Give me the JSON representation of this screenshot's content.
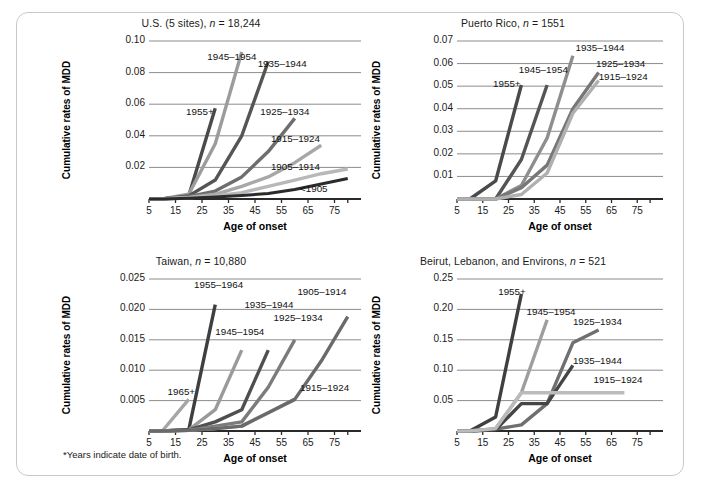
{
  "figure": {
    "footnote": "*Years indicate date of birth.",
    "shared": {
      "xlabel": "Age of onset",
      "ylabel": "Cumulative rates of MDD",
      "xticks": [
        "5",
        "15",
        "25",
        "35",
        "45",
        "55",
        "65",
        "75"
      ]
    }
  },
  "chart_data": [
    {
      "type": "line",
      "id": "us",
      "title": "U.S. (5 sites), n = 18,244",
      "title_plain": "U.S. (5 sites),",
      "title_italic": "n",
      "title_tail": "= 18,244",
      "xlabel": "Age of onset",
      "ylabel": "Cumulative rates of MDD",
      "xlim": [
        0,
        80
      ],
      "ylim": [
        0,
        0.1
      ],
      "xticks": [
        5,
        15,
        25,
        35,
        45,
        55,
        65,
        75
      ],
      "yticks": [
        0.02,
        0.04,
        0.06,
        0.08,
        0.1
      ],
      "ytick_labels": [
        "0.02",
        "0.04",
        "0.06",
        "0.08",
        "0.10"
      ],
      "grid": true,
      "legend_position": "inline-annotations",
      "series": [
        {
          "name": "1955+",
          "color": "#4a4a4a",
          "x": [
            0,
            5,
            15,
            25
          ],
          "values": [
            0,
            0,
            0.002,
            0.0575
          ]
        },
        {
          "name": "1945–1954",
          "color": "#9c9c9c",
          "x": [
            0,
            5,
            15,
            25,
            35
          ],
          "values": [
            0,
            0,
            0.003,
            0.035,
            0.093
          ]
        },
        {
          "name": "1935–1944",
          "color": "#555555",
          "x": [
            0,
            5,
            15,
            25,
            35,
            45
          ],
          "values": [
            0,
            0,
            0.002,
            0.012,
            0.04,
            0.087
          ]
        },
        {
          "name": "1925–1934",
          "color": "#6e6e6e",
          "x": [
            0,
            5,
            15,
            25,
            35,
            45,
            55
          ],
          "values": [
            0,
            0,
            0.0015,
            0.005,
            0.014,
            0.03,
            0.051
          ]
        },
        {
          "name": "1915–1924",
          "color": "#a8a8a8",
          "x": [
            0,
            5,
            15,
            25,
            35,
            45,
            55,
            65
          ],
          "values": [
            0,
            0,
            0.001,
            0.003,
            0.008,
            0.014,
            0.023,
            0.034
          ]
        },
        {
          "name": "1905–1914",
          "color": "#b8b8b8",
          "x": [
            0,
            5,
            15,
            25,
            35,
            45,
            55,
            65,
            75
          ],
          "values": [
            0,
            0,
            0.0008,
            0.002,
            0.004,
            0.008,
            0.012,
            0.016,
            0.019
          ]
        },
        {
          "name": "<1905",
          "color": "#2b2b2b",
          "x": [
            0,
            5,
            15,
            25,
            35,
            45,
            55,
            65,
            75
          ],
          "values": [
            0,
            0,
            0.0005,
            0.0012,
            0.0022,
            0.0035,
            0.006,
            0.0095,
            0.013
          ]
        }
      ],
      "annotations": [
        {
          "text": "1945–1954",
          "x": 22,
          "y": 0.0895
        },
        {
          "text": "1935–1944",
          "x": 41,
          "y": 0.085
        },
        {
          "text": "1955+",
          "x": 14,
          "y": 0.0545
        },
        {
          "text": "1925–1934",
          "x": 42,
          "y": 0.0545
        },
        {
          "text": "1915–1924",
          "x": 46,
          "y": 0.0375
        },
        {
          "text": "1905–1914",
          "x": 46,
          "y": 0.0195
        },
        {
          "text": "<1905",
          "x": 57,
          "y": 0.0055
        }
      ]
    },
    {
      "type": "line",
      "id": "puerto_rico",
      "title": "Puerto Rico, n = 1551",
      "title_plain": "Puerto Rico,",
      "title_italic": "n",
      "title_tail": "= 1551",
      "xlabel": "Age of onset",
      "ylabel": "Cumulative rates of MDD",
      "xlim": [
        0,
        80
      ],
      "ylim": [
        0,
        0.07
      ],
      "xticks": [
        5,
        15,
        25,
        35,
        45,
        55,
        65,
        75
      ],
      "yticks": [
        0.01,
        0.02,
        0.03,
        0.04,
        0.05,
        0.06,
        0.07
      ],
      "ytick_labels": [
        "0.01",
        "0.02",
        "0.03",
        "0.04",
        "0.05",
        "0.06",
        "0.07"
      ],
      "grid": true,
      "legend_position": "inline-annotations",
      "series": [
        {
          "name": "1955+",
          "color": "#4a4a4a",
          "x": [
            0,
            5,
            15,
            25
          ],
          "values": [
            0,
            0,
            0.008,
            0.0505
          ]
        },
        {
          "name": "1945–1954",
          "color": "#555555",
          "x": [
            0,
            5,
            15,
            25,
            35
          ],
          "values": [
            0,
            0,
            0,
            0.0175,
            0.0505
          ]
        },
        {
          "name": "1935–1944",
          "color": "#8e8e8e",
          "x": [
            0,
            5,
            15,
            25,
            35,
            45
          ],
          "values": [
            0,
            0,
            0,
            0.006,
            0.027,
            0.0635
          ]
        },
        {
          "name": "1925–1934",
          "color": "#777777",
          "x": [
            0,
            5,
            15,
            25,
            35,
            45,
            55
          ],
          "values": [
            0,
            0,
            0,
            0.005,
            0.015,
            0.04,
            0.056
          ]
        },
        {
          "name": "1915–1924",
          "color": "#b0b0b0",
          "x": [
            0,
            5,
            15,
            25,
            35,
            45,
            55
          ],
          "values": [
            0,
            0,
            0,
            0.002,
            0.0115,
            0.038,
            0.0525
          ]
        }
      ],
      "annotations": [
        {
          "text": "1935–1944",
          "x": 46,
          "y": 0.0665
        },
        {
          "text": "1925–1934",
          "x": 54,
          "y": 0.0595
        },
        {
          "text": "1945–1954",
          "x": 24,
          "y": 0.0565
        },
        {
          "text": "1915–1924",
          "x": 55,
          "y": 0.0535
        },
        {
          "text": "1955+",
          "x": 14,
          "y": 0.0505
        }
      ]
    },
    {
      "type": "line",
      "id": "taiwan",
      "title": "Taiwan, n = 10,880",
      "title_plain": "Taiwan,",
      "title_italic": "n",
      "title_tail": "= 10,880",
      "xlabel": "Age of onset",
      "ylabel": "Cumulative rates of MDD",
      "xlim": [
        0,
        80
      ],
      "ylim": [
        0,
        0.025
      ],
      "xticks": [
        5,
        15,
        25,
        35,
        45,
        55,
        65,
        75
      ],
      "yticks": [
        0.005,
        0.01,
        0.015,
        0.02,
        0.025
      ],
      "ytick_labels": [
        "0.005",
        "0.010",
        "0.015",
        "0.020",
        "0.025"
      ],
      "grid": true,
      "legend_position": "inline-annotations",
      "series": [
        {
          "name": "1965+",
          "color": "#a6a6a6",
          "x": [
            0,
            5,
            15
          ],
          "values": [
            0,
            0,
            0.0052
          ]
        },
        {
          "name": "1955–1964",
          "color": "#3f3f3f",
          "x": [
            0,
            5,
            15,
            25
          ],
          "values": [
            0,
            0,
            0.0002,
            0.0208
          ]
        },
        {
          "name": "1945–1954",
          "color": "#9a9a9a",
          "x": [
            0,
            5,
            15,
            25,
            35
          ],
          "values": [
            0,
            0,
            0.0002,
            0.0035,
            0.0133
          ]
        },
        {
          "name": "1935–1944",
          "color": "#4f4f4f",
          "x": [
            0,
            5,
            15,
            25,
            35,
            45
          ],
          "values": [
            0,
            0,
            0.0002,
            0.0015,
            0.0035,
            0.0133
          ]
        },
        {
          "name": "1925–1934",
          "color": "#7b7b7b",
          "x": [
            0,
            5,
            15,
            25,
            35,
            45,
            55
          ],
          "values": [
            0,
            0,
            0.0001,
            0.0008,
            0.0015,
            0.0072,
            0.015
          ]
        },
        {
          "name": "1915–1924",
          "color": "#b4b4b4",
          "x": [
            0,
            5,
            15,
            25,
            35,
            45,
            55
          ],
          "values": [
            0,
            0,
            0.0001,
            0.0004,
            0.0008,
            0.003,
            0.0052
          ]
        },
        {
          "name": "1905–1914",
          "color": "#6a6a6a",
          "x": [
            0,
            5,
            15,
            25,
            35,
            45,
            55,
            65,
            75
          ],
          "values": [
            0,
            0,
            0.0001,
            0.0004,
            0.0008,
            0.003,
            0.0052,
            0.0115,
            0.0188
          ]
        }
      ],
      "annotations": [
        {
          "text": "1955–1964",
          "x": 17,
          "y": 0.0238
        },
        {
          "text": "1905–1914",
          "x": 56,
          "y": 0.0227
        },
        {
          "text": "1935–1944",
          "x": 36,
          "y": 0.0205
        },
        {
          "text": "1925–1934",
          "x": 47,
          "y": 0.0185
        },
        {
          "text": "1945–1954",
          "x": 25,
          "y": 0.0162
        },
        {
          "text": "1915–1924",
          "x": 57,
          "y": 0.0069
        },
        {
          "text": "1965+",
          "x": 7,
          "y": 0.0063
        }
      ]
    },
    {
      "type": "line",
      "id": "beirut",
      "title": "Beirut, Lebanon, and Environs, n = 521",
      "title_plain": "Beirut, Lebanon, and Environs,",
      "title_italic": "n",
      "title_tail": "= 521",
      "xlabel": "Age of onset",
      "ylabel": "Cumulative rates of MDD",
      "xlim": [
        0,
        80
      ],
      "ylim": [
        0,
        0.25
      ],
      "xticks": [
        5,
        15,
        25,
        35,
        45,
        55,
        65,
        75
      ],
      "yticks": [
        0.05,
        0.1,
        0.15,
        0.2,
        0.25
      ],
      "ytick_labels": [
        "0.05",
        "0.10",
        "0.15",
        "0.20",
        "0.25"
      ],
      "grid": true,
      "legend_position": "inline-annotations",
      "series": [
        {
          "name": "1955+",
          "color": "#3f3f3f",
          "x": [
            0,
            5,
            15,
            25
          ],
          "values": [
            0,
            0,
            0.023,
            0.2255
          ]
        },
        {
          "name": "1945–1954",
          "color": "#9e9e9e",
          "x": [
            0,
            5,
            15,
            25,
            35
          ],
          "values": [
            0,
            0,
            0.004,
            0.063,
            0.183
          ]
        },
        {
          "name": "1925–1934",
          "color": "#6f6f6f",
          "x": [
            0,
            5,
            15,
            25,
            35,
            45,
            55
          ],
          "values": [
            0,
            0,
            0.003,
            0.01,
            0.045,
            0.145,
            0.166
          ]
        },
        {
          "name": "1935–1944",
          "color": "#454545",
          "x": [
            0,
            5,
            15,
            25,
            35,
            45
          ],
          "values": [
            0,
            0,
            0.002,
            0.045,
            0.045,
            0.108
          ]
        },
        {
          "name": "1915–1924",
          "color": "#bbbbbb",
          "x": [
            0,
            5,
            15,
            25,
            35,
            45,
            55,
            65
          ],
          "values": [
            0,
            0,
            0.004,
            0.063,
            0.063,
            0.063,
            0.063,
            0.063
          ]
        }
      ],
      "annotations": [
        {
          "text": "1955+",
          "x": 16,
          "y": 0.2265
        },
        {
          "text": "1945–1954",
          "x": 27,
          "y": 0.1945
        },
        {
          "text": "1925–1934",
          "x": 45,
          "y": 0.178
        },
        {
          "text": "1935–1944",
          "x": 45,
          "y": 0.113
        },
        {
          "text": "1915–1924",
          "x": 53,
          "y": 0.083
        }
      ]
    }
  ]
}
